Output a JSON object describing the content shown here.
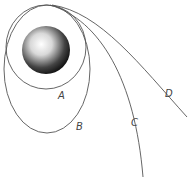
{
  "diagram": {
    "labels": {
      "A": "A",
      "B": "B",
      "C": "C",
      "D": "D"
    },
    "colors": {
      "line": "#555555",
      "label": "#444444",
      "background": "#ffffff"
    }
  }
}
